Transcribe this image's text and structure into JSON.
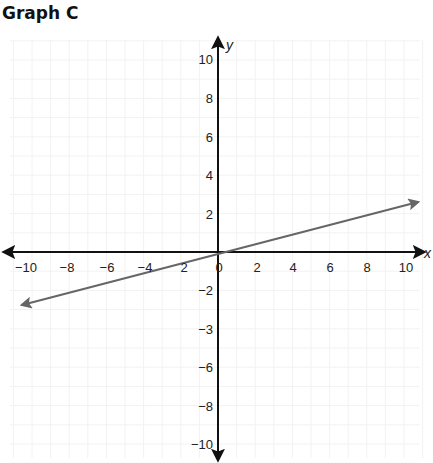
{
  "title": "Graph C",
  "chart_data": {
    "type": "line",
    "title": "Graph C",
    "xlabel": "x",
    "ylabel": "y",
    "xlim": [
      -10,
      10
    ],
    "ylim": [
      -10,
      10
    ],
    "grid": true,
    "x_tick_labels": [
      "−10",
      "−8",
      "−6",
      "−4",
      "2",
      "0",
      "2",
      "4",
      "6",
      "8",
      "10"
    ],
    "y_tick_labels_positive": [
      "10",
      "8",
      "6",
      "4",
      "2"
    ],
    "y_tick_labels_negative": [
      "−2",
      "−3",
      "−6",
      "−8",
      "−10"
    ],
    "series": [
      {
        "name": "line",
        "equation": "y = x/4",
        "x": [
          -10.6,
          0,
          10.8
        ],
        "y": [
          -2.65,
          0,
          2.7
        ],
        "arrows": "both",
        "color": "#666666"
      }
    ],
    "axis_color": "#111111",
    "grid_color": "#f2f2f2"
  },
  "labels": {
    "x_axis": "x",
    "y_axis": "y",
    "xticks": [
      {
        "text": "−10",
        "x": 26
      },
      {
        "text": "−8",
        "x": 67
      },
      {
        "text": "−6",
        "x": 107
      },
      {
        "text": "−4",
        "x": 145
      },
      {
        "text": "2",
        "x": 184
      },
      {
        "text": "0",
        "x": 219
      },
      {
        "text": "2",
        "x": 257
      },
      {
        "text": "4",
        "x": 293
      },
      {
        "text": "6",
        "x": 330
      },
      {
        "text": "8",
        "x": 367
      },
      {
        "text": "10",
        "x": 406
      }
    ],
    "yticks": [
      {
        "text": "10",
        "y": 64
      },
      {
        "text": "8",
        "y": 103
      },
      {
        "text": "6",
        "y": 142
      },
      {
        "text": "4",
        "y": 180
      },
      {
        "text": "2",
        "y": 219
      },
      {
        "text": "−2",
        "y": 295
      },
      {
        "text": "−3",
        "y": 334
      },
      {
        "text": "−6",
        "y": 372
      },
      {
        "text": "−8",
        "y": 411
      },
      {
        "text": "−10",
        "y": 449
      }
    ]
  }
}
